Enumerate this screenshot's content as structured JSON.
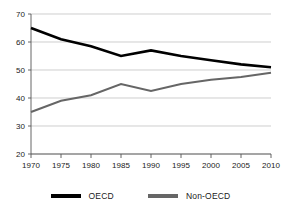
{
  "chart_data": {
    "type": "line",
    "title": "",
    "xlabel": "",
    "ylabel": "",
    "x": [
      1970,
      1975,
      1980,
      1985,
      1990,
      1995,
      2000,
      2005,
      2010
    ],
    "categories": [
      "1970",
      "1975",
      "1980",
      "1985",
      "1990",
      "1995",
      "2000",
      "2005",
      "2010"
    ],
    "series": [
      {
        "name": "OECD",
        "color": "#000000",
        "values": [
          65,
          61,
          58.5,
          55,
          57,
          55,
          53.5,
          52,
          51
        ]
      },
      {
        "name": "Non-OECD",
        "color": "#666666",
        "values": [
          35,
          39,
          41,
          45,
          42.5,
          45,
          46.5,
          47.5,
          49
        ]
      }
    ],
    "ylim": [
      20,
      70
    ],
    "xlim": [
      1970,
      2010
    ],
    "yticks": [
      20,
      30,
      40,
      50,
      60,
      70
    ],
    "ytick_labels": [
      "20",
      "30",
      "40",
      "50",
      "60",
      "70"
    ],
    "xticks": [
      1970,
      1975,
      1980,
      1985,
      1990,
      1995,
      2000,
      2005,
      2010
    ],
    "xtick_labels": [
      "1970",
      "1975",
      "1980",
      "1985",
      "1990",
      "1995",
      "2000",
      "2005",
      "2010"
    ],
    "grid": true,
    "grid_axis": "y",
    "legend_position": "bottom"
  },
  "legend": {
    "entries": [
      {
        "label": "OECD",
        "color": "#000000"
      },
      {
        "label": "Non-OECD",
        "color": "#666666"
      }
    ]
  },
  "colors": {
    "oecd": "#000000",
    "non_oecd": "#666666",
    "gridline": "#b9b9b9",
    "axis": "#555555",
    "background": "#ffffff",
    "text": "#1a1a1a"
  }
}
